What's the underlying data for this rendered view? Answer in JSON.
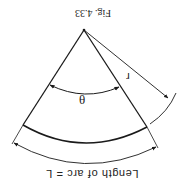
{
  "figure": {
    "caption": "Fig. 4.33",
    "orientation": "rotated 180 degrees",
    "labels": {
      "angle": "θ",
      "radius": "r",
      "arc_length": "Length of arc = L"
    },
    "colors": {
      "line": "#1a1a1a",
      "background": "#ffffff"
    }
  }
}
